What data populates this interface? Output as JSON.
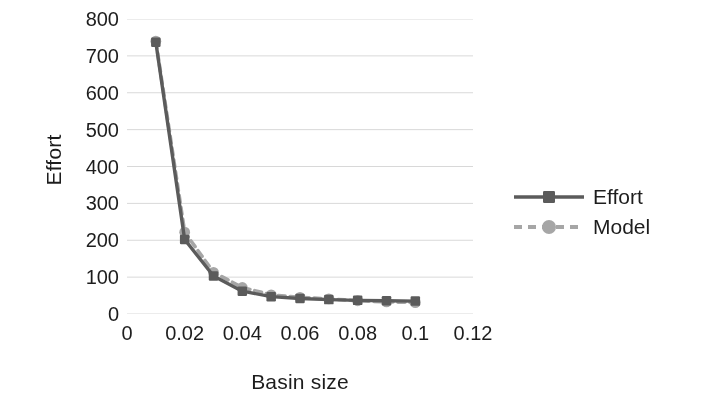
{
  "chart_data": {
    "type": "line",
    "title": "",
    "xlabel": "Basin size",
    "ylabel": "Effort",
    "xlim": [
      0,
      0.12
    ],
    "ylim": [
      0,
      800
    ],
    "xticks": [
      "0",
      "0.02",
      "0.04",
      "0.06",
      "0.08",
      "0.1",
      "0.12"
    ],
    "xtick_values": [
      0,
      0.02,
      0.04,
      0.06,
      0.08,
      0.1,
      0.12
    ],
    "yticks": [
      "0",
      "100",
      "200",
      "300",
      "400",
      "500",
      "600",
      "700",
      "800"
    ],
    "ytick_values": [
      0,
      100,
      200,
      300,
      400,
      500,
      600,
      700,
      800
    ],
    "grid": "horizontal",
    "legend_position": "right",
    "x": [
      0.01,
      0.02,
      0.03,
      0.04,
      0.05,
      0.06,
      0.07,
      0.08,
      0.09,
      0.1
    ],
    "series": [
      {
        "name": "Effort",
        "color": "#595959",
        "marker": "square",
        "linestyle": "solid",
        "values": [
          737,
          202,
          103,
          62,
          47,
          42,
          39,
          37,
          36,
          35
        ]
      },
      {
        "name": "Model",
        "color": "#a6a6a6",
        "marker": "circle",
        "linestyle": "dashed",
        "values": [
          740,
          222,
          113,
          72,
          52,
          45,
          41,
          36,
          33,
          31
        ]
      }
    ]
  },
  "legend": {
    "items": [
      {
        "label": "Effort"
      },
      {
        "label": "Model"
      }
    ]
  },
  "colors": {
    "effort": "#595959",
    "model": "#a6a6a6",
    "grid": "#d9d9d9",
    "text": "#1a1a1a",
    "background": "#ffffff"
  }
}
